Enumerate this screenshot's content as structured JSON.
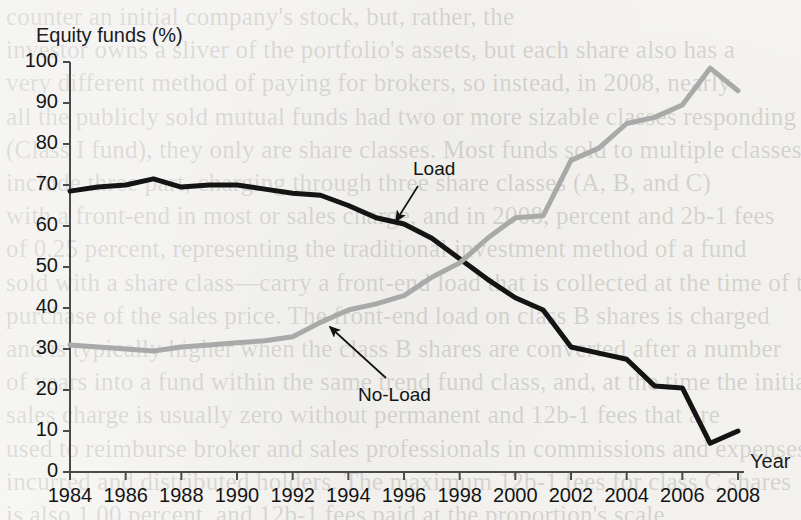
{
  "page": {
    "background_color": "#f7f6f3",
    "ink_color": "#141414",
    "ghost_text": "counter an initial company's stock, but, rather, the\ninvestor owns a sliver of the portfolio's assets, but each share also has a\nvery different method of paying for brokers, so instead, in 2008, nearly\nall the publicly sold mutual funds had two or more sizable classes responding to\n(Class I fund), they only are share classes. Most funds sold to multiple classes\ninclude three part, charging through three share classes (A, B, and C)\nwith a front-end in most or sales charge, and in 2008, percent and 2b-1 fees\nof 0.25 percent, representing the traditional investment method of a fund\nsold with a share class—carry a front-end load that is collected at the time of the initial\npurchase of the sales price. The front-end load on class B shares is charged\nand is typically higher when the class B shares are converted after a number\nof years into a fund within the same trend fund class, and, at the time the initial\nsales charge is usually zero without permanent and 12b-1 fees that are\nused to reimburse broker and sales professionals in commissions and expenses\nincurred and distributed holders. The maximum 12b-1 fees for class C shares\nis also 1.00 percent, and 12b-1 fees paid at the proportion's scale."
  },
  "chart_data": {
    "type": "line",
    "title": "",
    "ylabel": "Equity funds (%)",
    "xlabel": "Year",
    "xlim": [
      1984,
      2008
    ],
    "ylim": [
      0,
      100
    ],
    "grid": false,
    "legend_position": "inline-annotations",
    "y_ticks": [
      0,
      10,
      20,
      30,
      40,
      50,
      60,
      70,
      80,
      90,
      100
    ],
    "x_ticks": [
      1984,
      1986,
      1988,
      1990,
      1992,
      1994,
      1996,
      1998,
      2000,
      2002,
      2004,
      2006,
      2008
    ],
    "x": [
      1984,
      1985,
      1986,
      1987,
      1988,
      1989,
      1990,
      1991,
      1992,
      1993,
      1994,
      1995,
      1996,
      1997,
      1998,
      1999,
      2000,
      2001,
      2002,
      2003,
      2004,
      2005,
      2006,
      2007,
      2008
    ],
    "series": [
      {
        "name": "Load",
        "color": "#141414",
        "width": 5.0,
        "values": [
          68.5,
          69.5,
          70.0,
          71.5,
          69.5,
          70.0,
          70.0,
          69.0,
          68.0,
          67.5,
          65.0,
          62.0,
          60.5,
          57.0,
          52.0,
          47.0,
          42.5,
          39.5,
          30.5,
          29.0,
          27.5,
          21.0,
          20.5,
          7.0,
          10.0
        ]
      },
      {
        "name": "No-Load",
        "color": "#a9a9a9",
        "width": 5.0,
        "values": [
          31.0,
          30.5,
          30.0,
          29.5,
          30.5,
          31.0,
          31.5,
          32.0,
          33.0,
          36.5,
          39.5,
          41.0,
          43.0,
          47.5,
          51.0,
          57.0,
          62.0,
          62.5,
          76.0,
          79.0,
          85.0,
          86.5,
          89.5,
          98.5,
          93.0
        ]
      }
    ],
    "annotations": [
      {
        "text": "Load",
        "target_series": "Load",
        "label_x": 413,
        "label_y": 158,
        "arrow_from": [
          418,
          186
        ],
        "arrow_to": [
          396,
          221
        ]
      },
      {
        "text": "No-Load",
        "target_series": "No-Load",
        "label_x": 358,
        "label_y": 384,
        "arrow_from": [
          386,
          378
        ],
        "arrow_to": [
          330,
          327
        ]
      }
    ]
  },
  "axes": {
    "y_axis_label": "Equity funds (%)",
    "x_axis_label": "Year",
    "y_tick_labels": [
      "100",
      "90",
      "80",
      "70",
      "60",
      "50",
      "40",
      "30",
      "20",
      "10",
      "0"
    ],
    "x_tick_labels": [
      "1984",
      "1986",
      "1988",
      "1990",
      "1992",
      "1994",
      "1996",
      "1998",
      "2000",
      "2002",
      "2004",
      "2006",
      "2008"
    ]
  }
}
